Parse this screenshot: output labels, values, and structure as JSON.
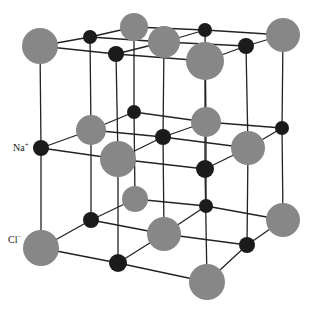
{
  "diagram": {
    "type": "crystal-lattice",
    "colors": {
      "cl": "#878787",
      "na": "#1b1b1b",
      "bond": "#222222",
      "background": "#ffffff"
    },
    "labels": {
      "na": {
        "text": "Na",
        "charge": "+"
      },
      "cl": {
        "text": "Cl",
        "charge": "−"
      }
    },
    "layers": [
      {
        "name": "top",
        "atoms": [
          {
            "id": "t00",
            "el": "Cl",
            "x": 40,
            "y": 46,
            "r": 18
          },
          {
            "id": "t01",
            "el": "Na",
            "x": 90,
            "y": 37,
            "r": 7
          },
          {
            "id": "t02",
            "el": "Cl",
            "x": 134,
            "y": 27,
            "r": 14
          },
          {
            "id": "t10",
            "el": "Na",
            "x": 116,
            "y": 54,
            "r": 8
          },
          {
            "id": "t11",
            "el": "Cl",
            "x": 164,
            "y": 42,
            "r": 16
          },
          {
            "id": "t12",
            "el": "Na",
            "x": 205,
            "y": 30,
            "r": 7
          },
          {
            "id": "t20",
            "el": "Cl",
            "x": 205,
            "y": 61,
            "r": 19
          },
          {
            "id": "t21",
            "el": "Na",
            "x": 246,
            "y": 46,
            "r": 8
          },
          {
            "id": "t22",
            "el": "Cl",
            "x": 283,
            "y": 35,
            "r": 17
          }
        ]
      },
      {
        "name": "middle",
        "atoms": [
          {
            "id": "m00",
            "el": "Na",
            "x": 41,
            "y": 148,
            "r": 8
          },
          {
            "id": "m01",
            "el": "Cl",
            "x": 91,
            "y": 130,
            "r": 15
          },
          {
            "id": "m02",
            "el": "Na",
            "x": 134,
            "y": 112,
            "r": 7
          },
          {
            "id": "m10",
            "el": "Cl",
            "x": 118,
            "y": 159,
            "r": 18
          },
          {
            "id": "m11",
            "el": "Na",
            "x": 163,
            "y": 137,
            "r": 8
          },
          {
            "id": "m12",
            "el": "Cl",
            "x": 206,
            "y": 122,
            "r": 15
          },
          {
            "id": "m20",
            "el": "Na",
            "x": 205,
            "y": 169,
            "r": 9
          },
          {
            "id": "m21",
            "el": "Cl",
            "x": 248,
            "y": 148,
            "r": 17
          },
          {
            "id": "m22",
            "el": "Na",
            "x": 282,
            "y": 128,
            "r": 7
          }
        ]
      },
      {
        "name": "bottom",
        "atoms": [
          {
            "id": "b00",
            "el": "Cl",
            "x": 41,
            "y": 248,
            "r": 18
          },
          {
            "id": "b01",
            "el": "Na",
            "x": 91,
            "y": 220,
            "r": 8
          },
          {
            "id": "b02",
            "el": "Cl",
            "x": 135,
            "y": 199,
            "r": 13
          },
          {
            "id": "b10",
            "el": "Na",
            "x": 118,
            "y": 263,
            "r": 9
          },
          {
            "id": "b11",
            "el": "Cl",
            "x": 164,
            "y": 234,
            "r": 17
          },
          {
            "id": "b12",
            "el": "Na",
            "x": 206,
            "y": 206,
            "r": 7
          },
          {
            "id": "b20",
            "el": "Cl",
            "x": 207,
            "y": 282,
            "r": 18
          },
          {
            "id": "b21",
            "el": "Na",
            "x": 247,
            "y": 245,
            "r": 8
          },
          {
            "id": "b22",
            "el": "Cl",
            "x": 283,
            "y": 220,
            "r": 17
          }
        ]
      }
    ]
  }
}
